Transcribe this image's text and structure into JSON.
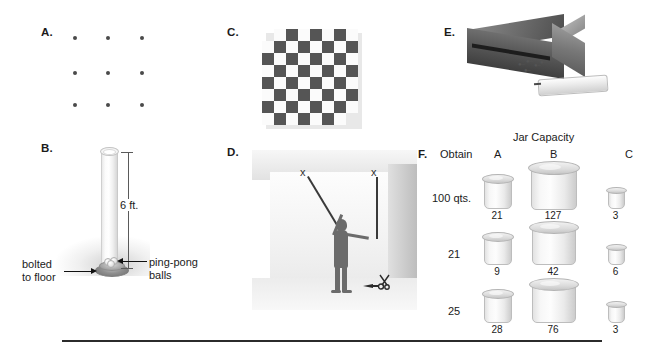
{
  "figure": {
    "panels": [
      {
        "id": "A",
        "letter": "A.",
        "name": "nine-dot-problem"
      },
      {
        "id": "B",
        "letter": "B.",
        "name": "ping-pong-ball-problem"
      },
      {
        "id": "C",
        "letter": "C.",
        "name": "mutilated-checkerboard-problem"
      },
      {
        "id": "D",
        "letter": "D.",
        "name": "two-string-problem"
      },
      {
        "id": "E",
        "letter": "E.",
        "name": "candle-box-of-tacks-problem"
      },
      {
        "id": "F",
        "letter": "F.",
        "name": "water-jar-problem"
      }
    ]
  },
  "panel_a": {
    "rows": 3,
    "cols": 3,
    "dot_color": "#4a4a4a"
  },
  "panel_b": {
    "dimension_label": "6 ft.",
    "label_bolted": "bolted",
    "label_bolted2": "to floor",
    "label_balls": "ping-pong",
    "label_balls2": "balls"
  },
  "panel_c": {
    "size": 8,
    "dark_color": "#555555",
    "light_color": "#fbfbfb",
    "removed_corners": [
      "top-left",
      "bottom-right"
    ]
  },
  "panel_d": {
    "objects": [
      "string-left",
      "string-right",
      "person",
      "pliers",
      "scissors"
    ]
  },
  "panel_e": {
    "objects": [
      "box",
      "tacks",
      "candle"
    ]
  },
  "panel_f": {
    "title": "Jar Capacity",
    "obtain_header": "Obtain",
    "columns": [
      "A",
      "B",
      "C"
    ],
    "rows": [
      {
        "obtain": "100 qts.",
        "a": "21",
        "b": "127",
        "c": "3"
      },
      {
        "obtain": "21",
        "a": "9",
        "b": "42",
        "c": "6"
      },
      {
        "obtain": "25",
        "a": "28",
        "b": "76",
        "c": "3"
      }
    ]
  }
}
